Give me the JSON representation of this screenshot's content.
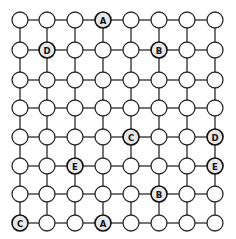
{
  "diagram": {
    "type": "grid-puzzle",
    "rows": 8,
    "cols": 8,
    "background": "#ffffff",
    "line_color": "#2a2a2a",
    "labeled_nodes": [
      {
        "row": 0,
        "col": 3,
        "label": "A"
      },
      {
        "row": 1,
        "col": 1,
        "label": "D"
      },
      {
        "row": 1,
        "col": 5,
        "label": "B"
      },
      {
        "row": 4,
        "col": 4,
        "label": "C"
      },
      {
        "row": 4,
        "col": 7,
        "label": "D"
      },
      {
        "row": 5,
        "col": 2,
        "label": "E"
      },
      {
        "row": 5,
        "col": 7,
        "label": "E"
      },
      {
        "row": 6,
        "col": 5,
        "label": "B"
      },
      {
        "row": 7,
        "col": 0,
        "label": "C"
      },
      {
        "row": 7,
        "col": 3,
        "label": "A"
      }
    ]
  }
}
